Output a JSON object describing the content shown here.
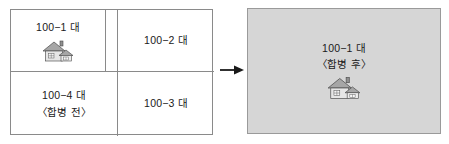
{
  "diagram": {
    "before": {
      "caption": "〈합병 전〉",
      "parcels": [
        {
          "id": "tl",
          "label": "100−1 대",
          "sub": "",
          "icon": "house-icon"
        },
        {
          "id": "tr",
          "label": "100−2 대",
          "sub": "",
          "icon": ""
        },
        {
          "id": "bl",
          "label": "100−4 대",
          "sub": "〈합병 전〉",
          "icon": ""
        },
        {
          "id": "br",
          "label": "100−3 대",
          "sub": "",
          "icon": ""
        }
      ]
    },
    "arrow": {
      "icon": "arrow-right-icon",
      "direction": "right"
    },
    "after": {
      "label": "100−1 대",
      "caption": "〈합병 후〉",
      "icon": "house-icon"
    },
    "colors": {
      "border": "#8a8a8a",
      "panel_fill": "#d6d6d6",
      "panel_border": "#9a9a9a",
      "text": "#1a1a1a",
      "background": "#ffffff",
      "house_roof": "#9b9b9b",
      "house_wall": "#e8e8e8",
      "house_outline": "#4a4a4a"
    }
  }
}
